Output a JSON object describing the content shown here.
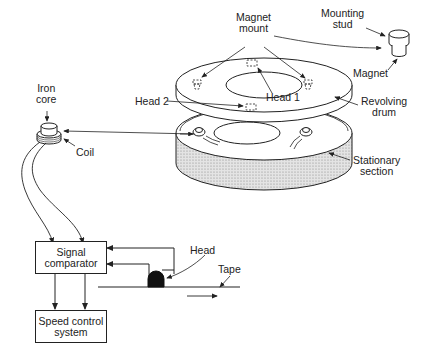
{
  "figure": {
    "type": "mechanical-diagram"
  },
  "labels": {
    "magnet_mount": "Magnet\nmount",
    "magnet_mount_l1": "Magnet",
    "magnet_mount_l2": "mount",
    "mounting_stud_l1": "Mounting",
    "mounting_stud_l2": "stud",
    "magnet": "Magnet",
    "iron_core_l1": "Iron",
    "iron_core_l2": "core",
    "head_2": "Head 2",
    "head_1": "Head 1",
    "revolving_drum_l1": "Revolving",
    "revolving_drum_l2": "drum",
    "coil": "Coil",
    "stationary_section_l1": "Stationary",
    "stationary_section_l2": "section",
    "head": "Head",
    "tape": "Tape"
  },
  "blocks": {
    "signal_comparator_l1": "Signal",
    "signal_comparator_l2": "comparator",
    "speed_control_l1": "Speed control",
    "speed_control_l2": "system"
  },
  "colors": {
    "line": "#222222",
    "shading": "#bdbdbd",
    "background": "#ffffff"
  }
}
